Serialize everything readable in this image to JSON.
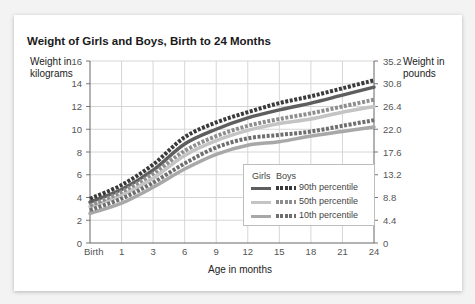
{
  "chart_data": {
    "type": "line",
    "title": "Weight of Girls and Boys, Birth to 24 Months",
    "xlabel": "Age in months",
    "ylabel_left": "Weight in kilograms",
    "ylabel_right": "Weight in pounds",
    "x_categories": [
      "Birth",
      "1",
      "3",
      "6",
      "9",
      "12",
      "15",
      "18",
      "21",
      "24"
    ],
    "x_values": [
      0,
      1,
      3,
      6,
      9,
      12,
      15,
      18,
      21,
      24
    ],
    "y_left_ticks": [
      "0",
      "2",
      "4",
      "6",
      "8",
      "10",
      "12",
      "14",
      "16"
    ],
    "y_right_ticks": [
      "0",
      "4.4",
      "8.8",
      "13.2",
      "17.6",
      "22.0",
      "26.4",
      "30.8",
      "35.2"
    ],
    "ylim": [
      0,
      16
    ],
    "grid": true,
    "legend_position": "lower right inside",
    "series": [
      {
        "name": "Boys 90th percentile",
        "group": "Boys",
        "percentile": "90th",
        "style": "dotted",
        "color": "#3a3a3a",
        "values": [
          3.9,
          5.1,
          6.9,
          9.3,
          10.6,
          11.5,
          12.3,
          12.9,
          13.6,
          14.3
        ]
      },
      {
        "name": "Girls 90th percentile",
        "group": "Girls",
        "percentile": "90th",
        "style": "solid",
        "color": "#5e5e5e",
        "values": [
          3.6,
          4.7,
          6.4,
          8.7,
          10.0,
          11.0,
          11.7,
          12.3,
          13.0,
          13.7
        ]
      },
      {
        "name": "Boys 50th percentile",
        "group": "Boys",
        "percentile": "50th",
        "style": "dotted",
        "color": "#8e8e8e",
        "values": [
          3.3,
          4.5,
          6.1,
          8.1,
          9.4,
          10.3,
          10.9,
          11.4,
          12.0,
          12.6
        ]
      },
      {
        "name": "Girls 50th percentile",
        "group": "Girls",
        "percentile": "50th",
        "style": "solid",
        "color": "#c4c4c4",
        "values": [
          3.2,
          4.2,
          5.7,
          7.7,
          9.0,
          9.9,
          10.5,
          10.9,
          11.5,
          12.0
        ]
      },
      {
        "name": "Boys 10th percentile",
        "group": "Boys",
        "percentile": "10th",
        "style": "dotted",
        "color": "#6e6e6e",
        "values": [
          2.9,
          3.9,
          5.3,
          7.0,
          8.4,
          9.2,
          9.5,
          9.8,
          10.3,
          10.8
        ]
      },
      {
        "name": "Girls 10th percentile",
        "group": "Girls",
        "percentile": "10th",
        "style": "solid",
        "color": "#a8a8a8",
        "values": [
          2.6,
          3.5,
          4.9,
          6.5,
          7.8,
          8.6,
          8.9,
          9.4,
          9.8,
          10.2
        ]
      }
    ]
  },
  "legend": {
    "girls_label": "Girls",
    "boys_label": "Boys",
    "rows": [
      {
        "label": "90th percentile",
        "girls_color": "#5e5e5e",
        "boys_color": "#3a3a3a"
      },
      {
        "label": "50th percentile",
        "girls_color": "#c4c4c4",
        "boys_color": "#8e8e8e"
      },
      {
        "label": "10th percentile",
        "girls_color": "#a8a8a8",
        "boys_color": "#6e6e6e"
      }
    ]
  },
  "labels": {
    "title": "Weight of Girls and Boys, Birth to 24 Months",
    "y_left": "Weight in kilograms",
    "y_right": "Weight in pounds",
    "x": "Age in months"
  }
}
